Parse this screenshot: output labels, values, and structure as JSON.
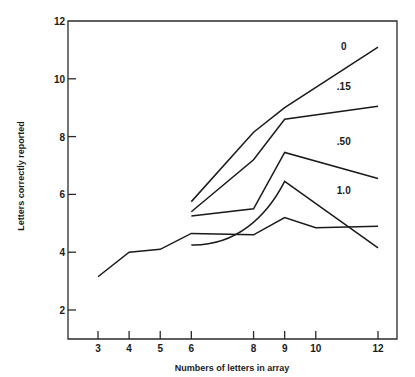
{
  "chart_data": {
    "type": "line",
    "title": "",
    "xlabel": "Numbers of letters in array",
    "ylabel": "Letters correctly reported",
    "xlim": [
      2.0,
      12.6
    ],
    "ylim": [
      1.0,
      12.0
    ],
    "x_ticks": [
      3,
      4,
      5,
      6,
      8,
      9,
      10,
      12
    ],
    "y_ticks": [
      2,
      4,
      6,
      8,
      10,
      12
    ],
    "grid": false,
    "legend": "inline labels near line ends",
    "series": [
      {
        "name": "0",
        "label": "0",
        "x": [
          6,
          8,
          9,
          12
        ],
        "values": [
          5.75,
          8.15,
          9.0,
          11.1
        ]
      },
      {
        "name": ".15",
        "label": ".15",
        "x": [
          6,
          8,
          9,
          12
        ],
        "values": [
          5.4,
          7.2,
          8.6,
          9.05
        ]
      },
      {
        "name": ".50",
        "label": ".50",
        "x": [
          6,
          8,
          9,
          12
        ],
        "values": [
          5.25,
          5.5,
          7.45,
          6.55
        ]
      },
      {
        "name": "1.0",
        "label": "1.0",
        "x": [
          6,
          8,
          9,
          12
        ],
        "values": [
          4.25,
          5.0,
          6.45,
          4.15
        ],
        "smooth_segment": "curved rise from 6 to 9"
      },
      {
        "name": "baseline (whole report)",
        "label": "",
        "x": [
          3,
          4,
          5,
          6,
          8,
          9,
          10,
          12
        ],
        "values": [
          3.15,
          4.0,
          4.1,
          4.65,
          4.6,
          5.2,
          4.85,
          4.9
        ]
      }
    ],
    "annotations": [
      {
        "text": "0",
        "x": 10.9,
        "y": 11.0
      },
      {
        "text": ".15",
        "x": 10.9,
        "y": 9.6
      },
      {
        "text": ".50",
        "x": 10.9,
        "y": 7.7
      },
      {
        "text": "1.0",
        "x": 10.9,
        "y": 6.0
      }
    ]
  },
  "axes": {
    "xlabel": "Numbers of letters in array",
    "ylabel": "Letters correctly reported"
  }
}
